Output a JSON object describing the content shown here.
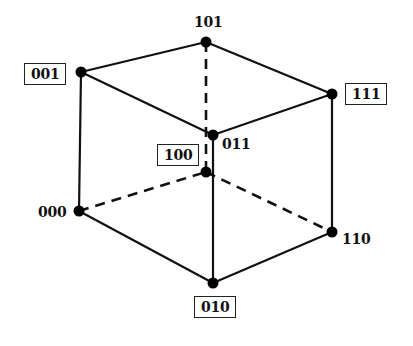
{
  "diagram": {
    "type": "binary-cube",
    "nodes": [
      {
        "id": "101",
        "label": "101",
        "x": 206,
        "y": 42,
        "boxed": false
      },
      {
        "id": "001",
        "label": "001",
        "x": 81,
        "y": 72,
        "boxed": true
      },
      {
        "id": "111",
        "label": "111",
        "x": 332,
        "y": 94,
        "boxed": true
      },
      {
        "id": "011",
        "label": "011",
        "x": 213,
        "y": 135,
        "boxed": false
      },
      {
        "id": "100",
        "label": "100",
        "x": 206,
        "y": 172,
        "boxed": true
      },
      {
        "id": "000",
        "label": "000",
        "x": 79,
        "y": 211,
        "boxed": false
      },
      {
        "id": "110",
        "label": "110",
        "x": 332,
        "y": 232,
        "boxed": false
      },
      {
        "id": "010",
        "label": "010",
        "x": 213,
        "y": 283,
        "boxed": true
      }
    ],
    "edges": [
      {
        "from": "001",
        "to": "101",
        "style": "solid"
      },
      {
        "from": "101",
        "to": "111",
        "style": "solid"
      },
      {
        "from": "001",
        "to": "011",
        "style": "solid"
      },
      {
        "from": "011",
        "to": "111",
        "style": "solid"
      },
      {
        "from": "001",
        "to": "000",
        "style": "solid"
      },
      {
        "from": "111",
        "to": "110",
        "style": "solid"
      },
      {
        "from": "011",
        "to": "010",
        "style": "solid"
      },
      {
        "from": "000",
        "to": "010",
        "style": "solid"
      },
      {
        "from": "010",
        "to": "110",
        "style": "solid"
      },
      {
        "from": "101",
        "to": "100",
        "style": "dashed"
      },
      {
        "from": "000",
        "to": "100",
        "style": "dashed"
      },
      {
        "from": "100",
        "to": "110",
        "style": "dashed"
      }
    ]
  },
  "labels": {
    "l101": "101",
    "l001": "001",
    "l111": "111",
    "l011": "011",
    "l100": "100",
    "l000": "000",
    "l110": "110",
    "l010": "010"
  }
}
